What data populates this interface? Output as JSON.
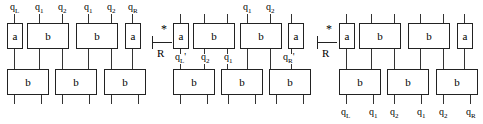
{
  "diagram": {
    "symbols": {
      "star": "*",
      "relation": "R"
    },
    "panels": [
      {
        "id": "left",
        "label_position": "top",
        "top_labels": [
          {
            "base": "q",
            "sub": "L"
          },
          {
            "base": "q",
            "sub": "1"
          },
          {
            "base": "q",
            "sub": "2"
          },
          {
            "base": "q",
            "sub": "1"
          },
          {
            "base": "q",
            "sub": "2"
          },
          {
            "base": "q",
            "sub": "R"
          }
        ],
        "top_row": [
          {
            "text": "a",
            "width": "narrow"
          },
          {
            "text": "b",
            "width": "wide"
          },
          {
            "text": "b",
            "width": "wide"
          },
          {
            "text": "a",
            "width": "narrow"
          }
        ],
        "bottom_row": [
          {
            "text": "b",
            "width": "wide"
          },
          {
            "text": "b",
            "width": "wide"
          },
          {
            "text": "b",
            "width": "wide"
          }
        ]
      },
      {
        "id": "middle",
        "label_position": "middle",
        "top_labels": [
          {
            "base": "q",
            "sub": "1"
          },
          {
            "base": "q",
            "sub": "2"
          }
        ],
        "middle_labels": [
          {
            "base": "q",
            "sub": "L",
            "prime": "'"
          },
          {
            "base": "q",
            "sub": "2"
          },
          {
            "base": "q",
            "sub": "1"
          },
          {
            "base": "q",
            "sub": "R",
            "prime": "'"
          }
        ],
        "top_row": [
          {
            "text": "a",
            "width": "narrow"
          },
          {
            "text": "b",
            "width": "wide"
          },
          {
            "text": "b",
            "width": "wide"
          },
          {
            "text": "a",
            "width": "narrow"
          }
        ],
        "bottom_row": [
          {
            "text": "b",
            "width": "wide"
          },
          {
            "text": "b",
            "width": "wide"
          },
          {
            "text": "b",
            "width": "wide"
          }
        ]
      },
      {
        "id": "right",
        "label_position": "bottom",
        "bottom_labels": [
          {
            "base": "q",
            "sub": "L"
          },
          {
            "base": "q",
            "sub": "1"
          },
          {
            "base": "q",
            "sub": "2"
          },
          {
            "base": "q",
            "sub": "1"
          },
          {
            "base": "q",
            "sub": "2"
          },
          {
            "base": "q",
            "sub": "R"
          }
        ],
        "top_row": [
          {
            "text": "a",
            "width": "narrow"
          },
          {
            "text": "b",
            "width": "wide"
          },
          {
            "text": "b",
            "width": "wide"
          },
          {
            "text": "a",
            "width": "narrow"
          }
        ],
        "bottom_row": [
          {
            "text": "b",
            "width": "wide"
          },
          {
            "text": "b",
            "width": "wide"
          },
          {
            "text": "b",
            "width": "wide"
          }
        ]
      }
    ]
  }
}
